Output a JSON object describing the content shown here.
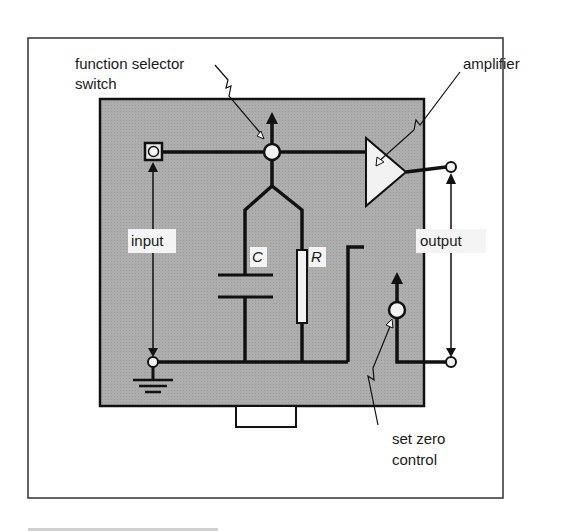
{
  "diagram": {
    "colors": {
      "background": "#ffffff",
      "panel": "#a9a9a9",
      "line": "#111111",
      "node_fill": "#f2f2f2",
      "label_bg": "#f4f4f4"
    },
    "callouts": {
      "function_selector": {
        "line1": "function selector",
        "line2": "switch"
      },
      "amplifier": "amplifier",
      "set_zero": {
        "line1": "set zero",
        "line2": "control"
      }
    },
    "terminal_labels": {
      "input": "input",
      "output": "output"
    },
    "components": {
      "capacitor": "C",
      "resistor": "R"
    },
    "icons": {
      "input_terminal": "square-terminal-icon",
      "ground": "ground-icon",
      "selector_switch": "rotary-switch-icon",
      "amplifier": "triangle-amplifier-icon",
      "set_zero_knob": "knob-icon"
    }
  }
}
